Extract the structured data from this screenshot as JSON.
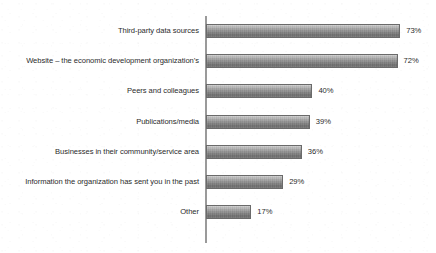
{
  "chart_title": "",
  "chart_data": {
    "type": "bar",
    "orientation": "horizontal",
    "title": "",
    "xlabel": "",
    "ylabel": "",
    "xlim": [
      0,
      80
    ],
    "grid": false,
    "legend": false,
    "value_suffix": "%",
    "categories": [
      "Third-party data sources",
      "Website – the economic development organization’s",
      "Peers and colleagues",
      "Publications/media",
      "Businesses in their community/service area",
      "Information the organization has sent you in the past",
      "Other"
    ],
    "values": [
      73,
      72,
      40,
      39,
      36,
      29,
      17
    ],
    "value_labels": [
      "73%",
      "72%",
      "40%",
      "39%",
      "36%",
      "29%",
      "17%"
    ]
  },
  "axis": {
    "pixels_per_percent": 2.66
  }
}
